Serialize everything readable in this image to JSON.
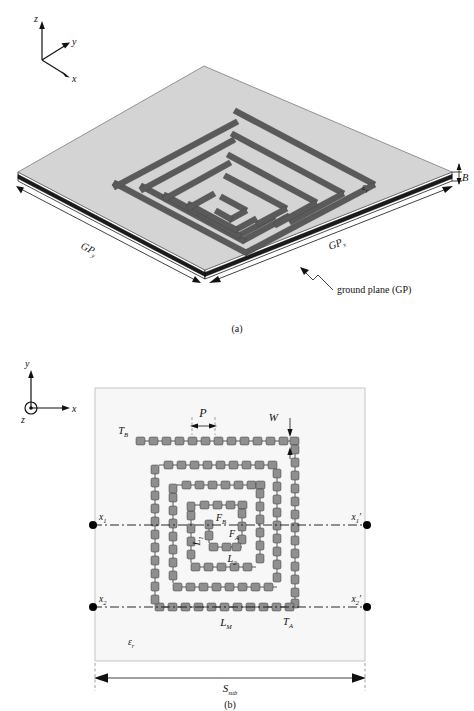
{
  "figure": {
    "panels": [
      {
        "id": "a",
        "caption": "(a)",
        "view": "3D perspective"
      },
      {
        "id": "b",
        "caption": "(b)",
        "view": "top view (x-y plane)"
      }
    ]
  },
  "panel_a": {
    "caption": "(a)",
    "axes": {
      "z": "z",
      "y": "y",
      "x": "x"
    },
    "labels": {
      "gp_y": "GP",
      "gp_y_sub": "y",
      "gp_x": "GP",
      "gp_x_sub": "x",
      "thickness": "B",
      "permittivity": "ε",
      "permittivity_sub": "r",
      "ground_plane": "ground plane (GP)"
    }
  },
  "panel_b": {
    "caption": "(b)",
    "axes": {
      "y": "y",
      "x": "x",
      "z": "z"
    },
    "labels": {
      "pitch": "P",
      "width": "W",
      "trace_top": "T",
      "trace_top_sub": "B",
      "trace_bottom": "T",
      "trace_bottom_sub": "A",
      "feed_b": "F",
      "feed_b_sub": "B",
      "feed_a": "F",
      "feed_a_sub": "A",
      "len_1": "L",
      "len_1_sub": "1",
      "len_2": "L",
      "len_2_sub": "2",
      "len_m": "L",
      "len_m_sub": "M",
      "substrate_size": "S",
      "substrate_size_sub": "sub",
      "permittivity": "ε",
      "permittivity_sub": "r",
      "port_1": "x",
      "port_1_sub": "1",
      "port_1_prime": "x",
      "port_1_prime_sub": "1",
      "port_2": "x",
      "port_2_sub": "2",
      "port_2_prime": "x",
      "port_2_prime_sub": "2",
      "prime_mark": "′"
    }
  },
  "colors": {
    "substrate_top": "#d4d4d4",
    "substrate_plane": "#f7f7f7",
    "trace_fill": "#8f8f8f",
    "trace_stroke": "#2b2b2b",
    "ground_edge": "#1b1b1b",
    "ink": "#111111"
  }
}
